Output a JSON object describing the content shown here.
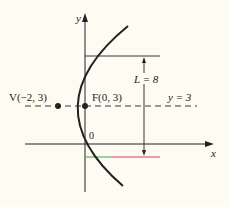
{
  "figure": {
    "axis_x_label": "x",
    "axis_y_label": "y",
    "origin_label": "0",
    "vertex_label": "V(−2, 3)",
    "focus_label": "F(0, 3)",
    "axis_line_label": "y = 3",
    "latus_rectum_label": "L = 8",
    "colors": {
      "ink": "#222222",
      "background": "#fdfbf2",
      "segment_green": "#3aa05a",
      "segment_red": "#d8385a"
    }
  }
}
